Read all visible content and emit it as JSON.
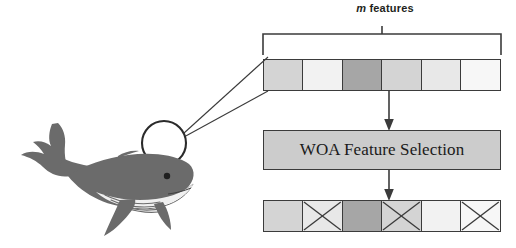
{
  "diagram": {
    "title_label": {
      "variable": "m",
      "text": " features"
    },
    "process_box": {
      "label": "WOA Feature Selection"
    },
    "colors": {
      "cell_stroke": "#3b3b3b",
      "cell_light": "#f2f2f2",
      "cell_medium": "#d4d4d4",
      "cell_dark": "#a6a6a6",
      "box_fill": "#cccccc",
      "whale_body": "#6b6b6b",
      "whale_belly": "#ffffff",
      "line": "#3b3b3b"
    },
    "input_row": {
      "name": "feature-vector-input",
      "cells": [
        {
          "index": 1,
          "shade": "#d4d4d4",
          "selected": true,
          "crossed": false
        },
        {
          "index": 2,
          "shade": "#f2f2f2",
          "selected": true,
          "crossed": false
        },
        {
          "index": 3,
          "shade": "#a6a6a6",
          "selected": true,
          "crossed": false
        },
        {
          "index": 4,
          "shade": "#d4d4d4",
          "selected": true,
          "crossed": false
        },
        {
          "index": 5,
          "shade": "#e8e8e8",
          "selected": true,
          "crossed": false
        },
        {
          "index": 6,
          "shade": "#f7f7f7",
          "selected": true,
          "crossed": false
        }
      ]
    },
    "output_row": {
      "name": "feature-vector-output",
      "cells": [
        {
          "index": 1,
          "shade": "#d4d4d4",
          "selected": true,
          "crossed": false
        },
        {
          "index": 2,
          "shade": "#e8e8e8",
          "selected": false,
          "crossed": true
        },
        {
          "index": 3,
          "shade": "#a6a6a6",
          "selected": true,
          "crossed": false
        },
        {
          "index": 4,
          "shade": "#d4d4d4",
          "selected": false,
          "crossed": true
        },
        {
          "index": 5,
          "shade": "#f2f2f2",
          "selected": true,
          "crossed": false
        },
        {
          "index": 6,
          "shade": "#f7f7f7",
          "selected": false,
          "crossed": true
        }
      ]
    },
    "arrows": [
      {
        "name": "arrow-input-to-woa",
        "direction": "down"
      },
      {
        "name": "arrow-woa-to-output",
        "direction": "down"
      }
    ],
    "illustration": {
      "whale": "whale-icon",
      "magnifier": "magnifier-circle-icon"
    }
  }
}
